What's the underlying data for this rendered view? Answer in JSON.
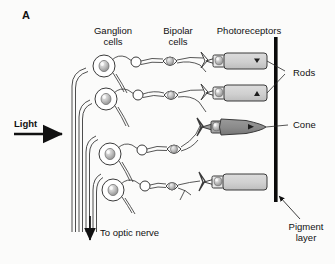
{
  "figure": {
    "panel_label": "A",
    "headers": [
      {
        "name": "ganglion",
        "text": "Ganglion\ncells"
      },
      {
        "name": "bipolar",
        "text": "Bipolar\ncells"
      },
      {
        "name": "photoreceptors",
        "text": "Photoreceptors"
      }
    ],
    "annotations": [
      {
        "name": "light",
        "text": "Light",
        "bold": true
      },
      {
        "name": "optic-nerve",
        "text": "To optic nerve",
        "bold": false
      },
      {
        "name": "rods",
        "text": "Rods",
        "bold": false
      },
      {
        "name": "cone",
        "text": "Cone",
        "bold": false
      },
      {
        "name": "pigment-layer",
        "text": "Pigment\nlayer",
        "bold": false
      }
    ],
    "colors": {
      "background": "#fbfbfa",
      "ink": "#111111",
      "rod_fill": "#d2d2d2",
      "cone_fill": "#8c8c8c",
      "nucleus_fill": "#b9b9b9",
      "pigment_bar": "#0a0a0a"
    },
    "cell_rows": [
      {
        "name": "row-1",
        "receptor": "rod",
        "marker": true
      },
      {
        "name": "row-2",
        "receptor": "rod",
        "marker": true
      },
      {
        "name": "row-3",
        "receptor": "cone",
        "marker": true
      },
      {
        "name": "row-4",
        "receptor": "rod",
        "marker": false
      }
    ]
  }
}
